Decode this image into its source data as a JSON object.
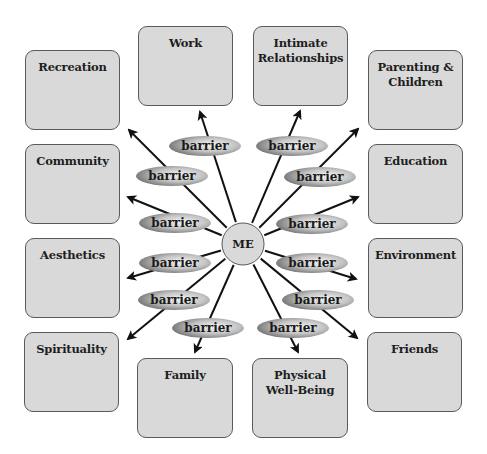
{
  "diagram": {
    "center": {
      "label": "ME",
      "cx": 243,
      "cy": 244,
      "r": 21
    },
    "barrier_label": "barrier",
    "colors": {
      "box_fill": "#d9d9d9",
      "box_border": "#5a5a5a",
      "barrier_edge": "#7d7d7d",
      "barrier_center": "#f4f4f4",
      "me_fill": "#d9d9d9",
      "line": "#111111"
    },
    "domains": [
      {
        "id": "recreation",
        "label": "Recreation",
        "x": 25,
        "y": 50,
        "w": 95,
        "h": 80
      },
      {
        "id": "work",
        "label": "Work",
        "x": 138,
        "y": 26,
        "w": 95,
        "h": 80
      },
      {
        "id": "intimate-relationships",
        "label": "Intimate\nRelationships",
        "x": 253,
        "y": 26,
        "w": 95,
        "h": 80
      },
      {
        "id": "parenting-children",
        "label": "Parenting &\nChildren",
        "x": 368,
        "y": 50,
        "w": 95,
        "h": 80
      },
      {
        "id": "community",
        "label": "Community",
        "x": 25,
        "y": 144,
        "w": 95,
        "h": 80
      },
      {
        "id": "education",
        "label": "Education",
        "x": 368,
        "y": 144,
        "w": 95,
        "h": 80
      },
      {
        "id": "aesthetics",
        "label": "Aesthetics",
        "x": 25,
        "y": 238,
        "w": 95,
        "h": 80
      },
      {
        "id": "environment",
        "label": "Environment",
        "x": 368,
        "y": 238,
        "w": 95,
        "h": 80
      },
      {
        "id": "spirituality",
        "label": "Spirituality",
        "x": 24,
        "y": 332,
        "w": 95,
        "h": 80
      },
      {
        "id": "friends",
        "label": "Friends",
        "x": 367,
        "y": 332,
        "w": 95,
        "h": 80
      },
      {
        "id": "family",
        "label": "Family",
        "x": 137,
        "y": 358,
        "w": 96,
        "h": 80
      },
      {
        "id": "physical-well-being",
        "label": "Physical\nWell-Being",
        "x": 252,
        "y": 358,
        "w": 96,
        "h": 80
      }
    ],
    "spokes": [
      {
        "to": "work",
        "tip": [
          200,
          112
        ],
        "barrier": [
          205,
          146
        ]
      },
      {
        "to": "intimate-relationships",
        "tip": [
          300,
          111
        ],
        "barrier": [
          292,
          146
        ]
      },
      {
        "to": "recreation",
        "tip": [
          129,
          130
        ],
        "barrier": [
          172,
          176
        ]
      },
      {
        "to": "parenting-children",
        "tip": [
          358,
          129
        ],
        "barrier": [
          320,
          177
        ]
      },
      {
        "to": "community",
        "tip": [
          128,
          197
        ],
        "barrier": [
          175,
          223
        ]
      },
      {
        "to": "education",
        "tip": [
          358,
          197
        ],
        "barrier": [
          312,
          224
        ]
      },
      {
        "to": "aesthetics",
        "tip": [
          128,
          278
        ],
        "barrier": [
          175,
          263
        ]
      },
      {
        "to": "environment",
        "tip": [
          356,
          279
        ],
        "barrier": [
          312,
          263
        ]
      },
      {
        "to": "spirituality",
        "tip": [
          128,
          339
        ],
        "barrier": [
          174,
          300
        ]
      },
      {
        "to": "friends",
        "tip": [
          357,
          338
        ],
        "barrier": [
          318,
          300
        ]
      },
      {
        "to": "family",
        "tip": [
          195,
          352
        ],
        "barrier": [
          208,
          328
        ]
      },
      {
        "to": "physical-well-being",
        "tip": [
          298,
          352
        ],
        "barrier": [
          293,
          328
        ]
      }
    ]
  }
}
